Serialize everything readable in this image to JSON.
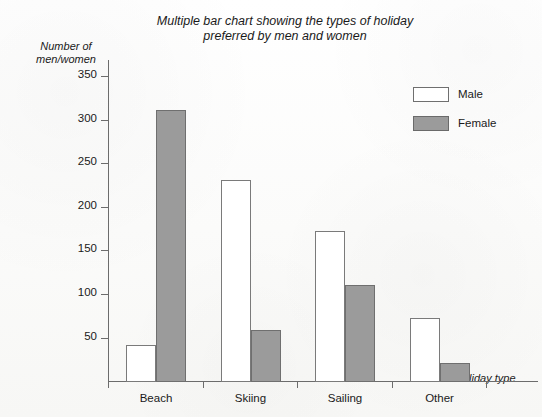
{
  "chart_data": {
    "type": "bar",
    "title": "Multiple bar chart showing the types of holiday preferred by men and women",
    "title_lines": [
      "Multiple bar chart showing the types of holiday",
      "preferred by men and women"
    ],
    "xlabel": "Holiday type",
    "ylabel": "Number of men/women",
    "ylabel_lines": [
      "Number of",
      "men/women"
    ],
    "categories": [
      "Beach",
      "Skiing",
      "Sailing",
      "Other"
    ],
    "series": [
      {
        "name": "Male",
        "values": [
          42,
          232,
          174,
          73
        ],
        "color": "#ffffff",
        "edge": "#7a7a7a"
      },
      {
        "name": "Female",
        "values": [
          312,
          60,
          112,
          22
        ],
        "color": "#9b9b9b",
        "edge": "#6f6f6f"
      }
    ],
    "ylim": [
      0,
      370
    ],
    "yticks": [
      50,
      100,
      150,
      200,
      250,
      300,
      350
    ],
    "ytick_labels": [
      "50",
      "100",
      "150",
      "200",
      "250",
      "300",
      "350"
    ],
    "grid": false,
    "legend_position": "upper-right",
    "legend_entries": [
      "Male",
      "Female"
    ]
  }
}
